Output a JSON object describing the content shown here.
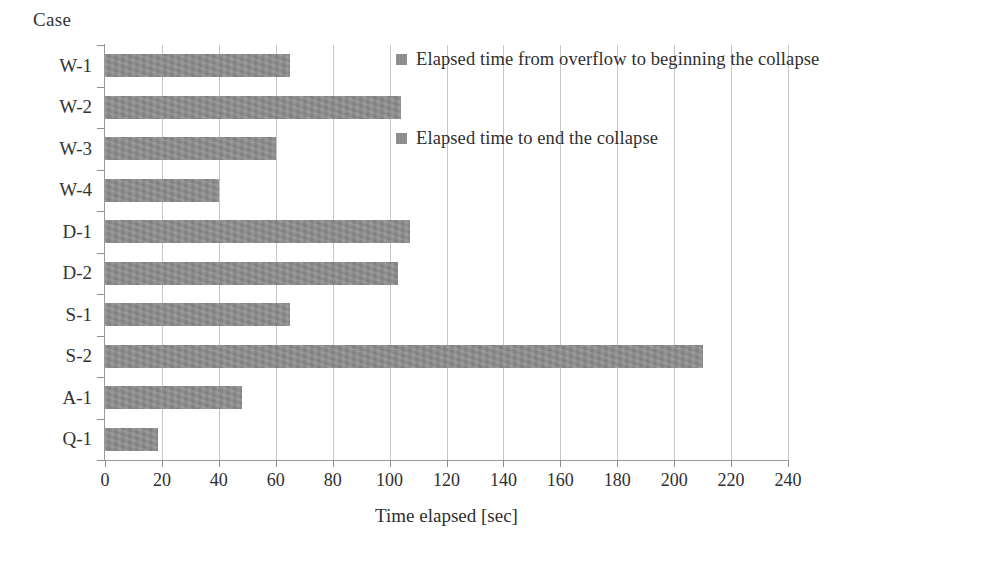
{
  "chart_data": {
    "type": "bar",
    "orientation": "horizontal",
    "title": "",
    "xlabel": "Time elapsed [sec]",
    "ylabel": "Case",
    "categories": [
      "W-1",
      "W-2",
      "W-3",
      "W-4",
      "D-1",
      "D-2",
      "S-1",
      "S-2",
      "A-1",
      "Q-1"
    ],
    "series": [
      {
        "name": "Elapsed time to end the collapse",
        "values": [
          65,
          104,
          60,
          40,
          107,
          103,
          65,
          210,
          48,
          18.5
        ]
      }
    ],
    "values": [
      65,
      104,
      60,
      40,
      107,
      103,
      65,
      210,
      48,
      18.5
    ],
    "xlim": [
      0,
      240
    ],
    "xticks": [
      0,
      20,
      40,
      60,
      80,
      100,
      120,
      140,
      160,
      180,
      200,
      220,
      240
    ],
    "xtick_labels": [
      "0",
      "20",
      "40",
      "60",
      "80",
      "100",
      "120",
      "140",
      "160",
      "180",
      "200",
      "220",
      "240"
    ],
    "grid": "vertical",
    "legend_position": "inside-top-right",
    "legend": [
      "Elapsed time from overflow to beginning the collapse",
      "Elapsed time to end the collapse"
    ],
    "bar_color": "#8c8c8c",
    "gridline_color": "#c6c6c6",
    "axis_color": "#9a9a9a"
  },
  "axes": {
    "y_title": "Case",
    "x_title": "Time elapsed [sec]"
  },
  "legend": {
    "entries": [
      {
        "label": "Elapsed time from overflow to beginning the collapse",
        "color": "#8c8c8c"
      },
      {
        "label": "Elapsed time to end the collapse",
        "color": "#8c8c8c"
      }
    ]
  }
}
